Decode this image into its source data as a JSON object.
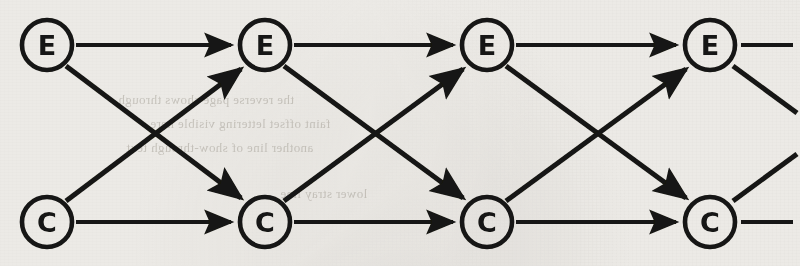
{
  "figure": {
    "type": "state-transition-trellis",
    "background_color": "#eceae6",
    "ink_color": "#141412",
    "width": 800,
    "height": 266,
    "stages": 4,
    "rows": 2,
    "row_labels": [
      "E",
      "C"
    ],
    "node_radius": 25,
    "row_y": {
      "top": 45,
      "bottom": 222
    },
    "stage_x": [
      47,
      265,
      487,
      710
    ]
  },
  "nodes": [
    {
      "id": "E0",
      "label": "E",
      "row": "top",
      "stage": 0,
      "cx": 47,
      "cy": 45
    },
    {
      "id": "E1",
      "label": "E",
      "row": "top",
      "stage": 1,
      "cx": 265,
      "cy": 45
    },
    {
      "id": "E2",
      "label": "E",
      "row": "top",
      "stage": 2,
      "cx": 487,
      "cy": 45
    },
    {
      "id": "E3",
      "label": "E",
      "row": "top",
      "stage": 3,
      "cx": 710,
      "cy": 45
    },
    {
      "id": "C0",
      "label": "C",
      "row": "bottom",
      "stage": 0,
      "cx": 47,
      "cy": 222
    },
    {
      "id": "C1",
      "label": "C",
      "row": "bottom",
      "stage": 1,
      "cx": 265,
      "cy": 222
    },
    {
      "id": "C2",
      "label": "C",
      "row": "bottom",
      "stage": 2,
      "cx": 487,
      "cy": 222
    },
    {
      "id": "C3",
      "label": "C",
      "row": "bottom",
      "stage": 3,
      "cx": 710,
      "cy": 222
    }
  ],
  "edges": [
    {
      "from": "E0",
      "to": "E1",
      "kind": "horizontal",
      "arrow": true
    },
    {
      "from": "C0",
      "to": "C1",
      "kind": "horizontal",
      "arrow": true
    },
    {
      "from": "E0",
      "to": "C1",
      "kind": "diagonal-down",
      "arrow": true
    },
    {
      "from": "C0",
      "to": "E1",
      "kind": "diagonal-up",
      "arrow": true
    },
    {
      "from": "E1",
      "to": "E2",
      "kind": "horizontal",
      "arrow": true
    },
    {
      "from": "C1",
      "to": "C2",
      "kind": "horizontal",
      "arrow": true
    },
    {
      "from": "E1",
      "to": "C2",
      "kind": "diagonal-down",
      "arrow": true
    },
    {
      "from": "C1",
      "to": "E2",
      "kind": "diagonal-up",
      "arrow": true
    },
    {
      "from": "E2",
      "to": "E3",
      "kind": "horizontal",
      "arrow": true
    },
    {
      "from": "C2",
      "to": "C3",
      "kind": "horizontal",
      "arrow": true
    },
    {
      "from": "E2",
      "to": "C3",
      "kind": "diagonal-down",
      "arrow": true
    },
    {
      "from": "C2",
      "to": "E3",
      "kind": "diagonal-up",
      "arrow": true
    }
  ],
  "continuation_stubs": [
    {
      "from": "E3",
      "kind": "horizontal",
      "note": "trellis continues right from E"
    },
    {
      "from": "E3",
      "kind": "diagonal-down",
      "note": "trellis continues right-down from E"
    },
    {
      "from": "C3",
      "kind": "horizontal",
      "note": "trellis continues right from C"
    },
    {
      "from": "C3",
      "kind": "diagonal-up",
      "note": "trellis continues right-up from C"
    }
  ],
  "bleed_through_text": [
    {
      "text": "the reverse page shows through",
      "x": 118,
      "y": 92
    },
    {
      "text": "faint offset lettering visible here",
      "x": 150,
      "y": 116
    },
    {
      "text": "another line of show-through text",
      "x": 126,
      "y": 140
    },
    {
      "text": "lower stray line",
      "x": 280,
      "y": 186
    }
  ]
}
